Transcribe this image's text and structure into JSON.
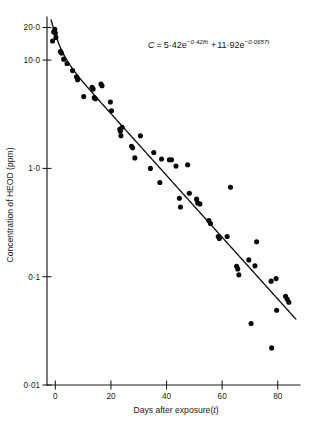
{
  "figure": {
    "background_color": "#ffffff",
    "ink_color": "#111111"
  },
  "annotation": {
    "equation_plain": "C = 5·42e^(-0·428t) + 11·92e^(-0·0657t)",
    "lhs": "C",
    "equals": "=",
    "term1_coeff": "5·42e",
    "term1_exponent": "−0·428t",
    "plus": "+",
    "term2_coeff": "11·92e",
    "term2_exponent": "−0·0657t"
  },
  "chart_data": {
    "type": "scatter",
    "title": "",
    "subtitle": "",
    "xlabel": "Days after exposure(t)",
    "ylabel": "Concentration of HEOD (ppm)",
    "xlabel_prefix": "Days after exposure(",
    "xlabel_var": "t",
    "xlabel_suffix": ")",
    "grid": false,
    "legend": false,
    "legend_position": "none",
    "xscale": "linear",
    "yscale": "log",
    "xlim": [
      -3,
      88
    ],
    "ylim": [
      0.01,
      25
    ],
    "xticks": [
      0,
      20,
      40,
      60,
      80
    ],
    "xtick_labels": [
      "0",
      "20",
      "40",
      "60",
      "80"
    ],
    "yticks": [
      0.01,
      0.1,
      1.0,
      10.0,
      20.0
    ],
    "ytick_labels": [
      "0·01",
      "0·1",
      "1·0",
      "10·0",
      "20·0"
    ],
    "series": [
      {
        "name": "HEOD concentration observations",
        "marker": "filled-circle",
        "color": "#080808",
        "points": [
          [
            -1.0,
            15.0
          ],
          [
            -0.6,
            18.2
          ],
          [
            -0.2,
            19.2
          ],
          [
            0.0,
            17.8
          ],
          [
            0.2,
            16.2
          ],
          [
            1.8,
            12.0
          ],
          [
            2.2,
            11.6
          ],
          [
            3.0,
            10.2
          ],
          [
            4.2,
            9.3
          ],
          [
            6.2,
            8.0
          ],
          [
            7.6,
            7.0
          ],
          [
            8.0,
            6.6
          ],
          [
            10.2,
            4.6
          ],
          [
            13.2,
            5.6
          ],
          [
            13.6,
            5.4
          ],
          [
            14.0,
            4.5
          ],
          [
            14.4,
            4.4
          ],
          [
            16.4,
            6.0
          ],
          [
            16.8,
            5.8
          ],
          [
            19.8,
            4.1
          ],
          [
            20.2,
            3.4
          ],
          [
            23.2,
            2.3
          ],
          [
            23.4,
            2.2
          ],
          [
            23.6,
            2.0
          ],
          [
            24.0,
            2.4
          ],
          [
            27.4,
            1.6
          ],
          [
            27.8,
            1.55
          ],
          [
            28.6,
            1.25
          ],
          [
            30.6,
            2.0
          ],
          [
            34.2,
            1.0
          ],
          [
            35.4,
            1.4
          ],
          [
            37.6,
            0.74
          ],
          [
            38.2,
            1.22
          ],
          [
            41.0,
            1.2
          ],
          [
            41.8,
            1.2
          ],
          [
            43.4,
            1.05
          ],
          [
            44.6,
            0.53
          ],
          [
            45.0,
            0.44
          ],
          [
            47.6,
            1.08
          ],
          [
            48.2,
            0.59
          ],
          [
            50.8,
            0.52
          ],
          [
            51.2,
            0.48
          ],
          [
            52.0,
            0.47
          ],
          [
            55.2,
            0.33
          ],
          [
            55.8,
            0.31
          ],
          [
            58.6,
            0.235
          ],
          [
            59.0,
            0.225
          ],
          [
            61.8,
            0.235
          ],
          [
            63.0,
            0.67
          ],
          [
            65.2,
            0.125
          ],
          [
            65.6,
            0.118
          ],
          [
            66.0,
            0.104
          ],
          [
            69.6,
            0.143
          ],
          [
            70.4,
            0.037
          ],
          [
            71.8,
            0.126
          ],
          [
            72.4,
            0.21
          ],
          [
            77.6,
            0.091
          ],
          [
            77.8,
            0.022
          ],
          [
            79.4,
            0.096
          ],
          [
            79.6,
            0.049
          ],
          [
            82.8,
            0.066
          ],
          [
            83.4,
            0.062
          ],
          [
            84.0,
            0.058
          ]
        ]
      }
    ],
    "fit": {
      "name": "biexponential fit",
      "model": "C = a1*exp(-k1*t) + a2*exp(-k2*t)",
      "a1": 5.42,
      "k1": 0.428,
      "a2": 11.92,
      "k2": 0.0657,
      "t_start": -1.5,
      "t_end": 86.5,
      "color": "#111111"
    }
  }
}
